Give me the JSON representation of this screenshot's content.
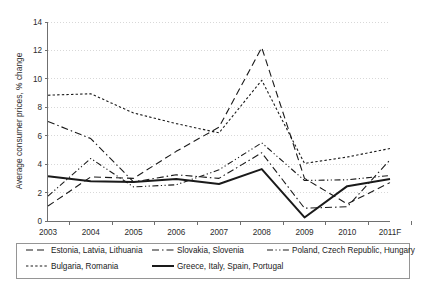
{
  "chart_data": {
    "type": "line",
    "title": "",
    "subtitle": "",
    "xlabel": "",
    "ylabel": "Average consumer prices, % change",
    "x": [
      "2003",
      "2004",
      "2005",
      "2006",
      "2007",
      "2008",
      "2009",
      "2010",
      "2011F"
    ],
    "xtick_labels": [
      "2003",
      "2004",
      "2005",
      "2006",
      "2007",
      "2008",
      "2009",
      "2010",
      "2011F"
    ],
    "ytick_labels": [
      "0",
      "2",
      "4",
      "6",
      "8",
      "10",
      "12",
      "14"
    ],
    "ytick_values": [
      0,
      2,
      4,
      6,
      8,
      10,
      12,
      14
    ],
    "ylim": [
      0,
      14
    ],
    "grid": "horizontal-dotted",
    "legend_position": "bottom",
    "series": [
      {
        "name": "Estonia, Latvia, Lithuania",
        "style": "dashed",
        "dasharray": "7 4",
        "width": 1.1,
        "values": [
          1.05,
          3.1,
          3.0,
          4.9,
          6.6,
          12.2,
          3.0,
          1.2,
          2.7
        ]
      },
      {
        "name": "Slovakia, Slovenia",
        "style": "dash-dot",
        "dasharray": "7 3 1.5 3",
        "width": 1.1,
        "values": [
          7.0,
          5.8,
          2.75,
          3.25,
          3.0,
          4.8,
          0.9,
          1.0,
          4.3
        ]
      },
      {
        "name": "Poland, Czech Republic, Hungary",
        "style": "dash-dot-dot",
        "dasharray": "6 2.5 1.2 2.5 1.2 2.5",
        "width": 1.1,
        "values": [
          1.75,
          4.4,
          2.4,
          2.55,
          3.6,
          5.5,
          2.85,
          2.9,
          3.2
        ]
      },
      {
        "name": "Bulgaria, Romania",
        "style": "dotted",
        "dasharray": "2.4 2.2",
        "width": 1.1,
        "values": [
          8.85,
          8.95,
          7.6,
          6.85,
          6.2,
          9.9,
          4.05,
          4.5,
          5.1
        ]
      },
      {
        "name": "Greece, Italy, Spain, Portugal",
        "style": "solid",
        "dasharray": "",
        "width": 2.0,
        "values": [
          3.15,
          2.8,
          2.75,
          2.95,
          2.6,
          3.65,
          0.25,
          2.45,
          2.95
        ]
      }
    ]
  },
  "legend": {
    "entries": [
      {
        "label": "Estonia, Latvia, Lithuania"
      },
      {
        "label": "Slovakia, Slovenia"
      },
      {
        "label": "Poland, Czech Republic, Hungary"
      },
      {
        "label": "Bulgaria, Romania"
      },
      {
        "label": "Greece, Italy, Spain, Portugal"
      }
    ]
  },
  "colors": {
    "ink": "#1a1a1a",
    "axis": "#6f6f6f",
    "grid": "#c8c8c8",
    "background": "#ffffff"
  }
}
